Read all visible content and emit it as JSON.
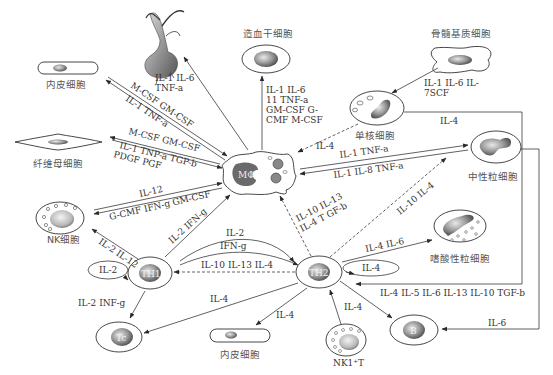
{
  "diagram": {
    "type": "cytokine-network",
    "colors": {
      "line": "#3a3a3a",
      "nucleus_dark": "#555555",
      "nucleus_light": "#dddddd",
      "background": "#ffffff"
    },
    "nodes": {
      "macrophage": {
        "label": "MΦ"
      },
      "neuron": {
        "label": ""
      },
      "hematopoietic_stem": {
        "label": "造血干细胞"
      },
      "bone_marrow_stromal": {
        "label": "骨髓基质细胞"
      },
      "endothelial_top": {
        "label": "内皮细胞"
      },
      "fibroblast": {
        "label": "纤维母细胞"
      },
      "monocyte": {
        "label": "单核细胞"
      },
      "neutrophil": {
        "label": "中性粒细胞"
      },
      "nk": {
        "label": "NK细胞"
      },
      "th1": {
        "label": "TH1"
      },
      "th2": {
        "label": "TH2"
      },
      "eosinophil": {
        "label": "嗜酸性粒细胞"
      },
      "tc": {
        "label": "Tc"
      },
      "endothelial_bottom": {
        "label": "内皮细胞"
      },
      "nk1t": {
        "label": "NK1⁺T"
      },
      "b": {
        "label": "B"
      }
    },
    "edges": {
      "mphi_to_neuron": [
        "IL-1 IL-6",
        "TNF-a"
      ],
      "mphi_to_hsc": [
        "IL-1 IL-6",
        "11 TNF-a",
        "GM-CSF G-",
        "CMF M-CSF"
      ],
      "stromal_to_monocyte": [
        "IL-1 IL-6 IL-",
        "7SCF"
      ],
      "endo_mphi_top": "M-CSF GM-CSF",
      "endo_mphi_bottom": "IL-1 TNF-a",
      "fibro_mphi_1": "M-CSF GM-CSF",
      "fibro_mphi_2": "IL-1 TNP-a TGP-b",
      "fibro_mphi_3": "PDGF PGF",
      "monocyte_to_mphi": "IL-4",
      "monocyte_to_th2": "IL-4",
      "neutro_mphi_top": "IL-1 TNF-a",
      "neutro_mphi_bottom": "IL-1 IL-8 TNF-a",
      "nk_mphi_top": "IL-12",
      "nk_mphi_bottom": "G-CMF IFN-g GM-CSF",
      "th1_to_mphi": "IL-2 IFN-g",
      "th2_to_mphi": [
        "IL-10 IL-13",
        "IL-4 T GF-b"
      ],
      "th2_to_neutro": "IL-10 IL-4",
      "th1_to_nk": "IL-2 IL-12",
      "th1_self": "IL-2",
      "th1_to_th2_a": "IL-2",
      "th1_to_th2_b": "IFN-g",
      "th2_to_th1": "IL-10 IL-13 IL-4",
      "th1_to_tc": "IL-2 INF-g",
      "th2_to_tc": "IL-4",
      "th2_to_endo": "IL-4",
      "nk1t_to_th2": "IL-4",
      "th2_to_eos": "IL-4 IL-6",
      "th2_self": "IL-4",
      "th2_to_b": "IL-4 IL-5 IL-6 IL-13 IL-10 TGF-b",
      "neutro_to_b": "IL-6"
    }
  }
}
